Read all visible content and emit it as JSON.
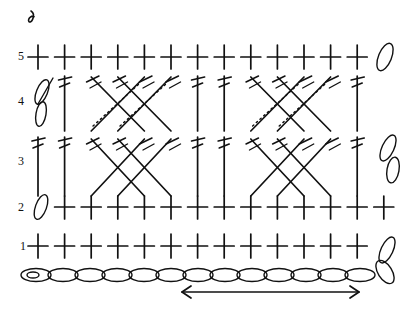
{
  "diagram": {
    "type": "crochet-pattern-chart",
    "width": 417,
    "height": 309,
    "ink_color": "#111111",
    "background_color": "#ffffff"
  },
  "row_labels": [
    {
      "label": "5",
      "x": 18,
      "y": 55
    },
    {
      "label": "4",
      "x": 18,
      "y": 100
    },
    {
      "label": "3",
      "x": 18,
      "y": 160
    },
    {
      "label": "2",
      "x": 18,
      "y": 207
    },
    {
      "label": "1",
      "x": 18,
      "y": 242
    }
  ],
  "rows": [
    {
      "number": "5",
      "y": 57,
      "stitch": "single-crochet",
      "symbol": "cross",
      "count": 13,
      "turning_chain_right": true
    },
    {
      "number": "4",
      "y": 100,
      "stitch": "crossed-treble-crochet",
      "symbol": "crossed-double-slash",
      "turning_chain_left": true
    },
    {
      "number": "3",
      "y": 158,
      "stitch": "crossed-treble-crochet",
      "symbol": "crossed-double-slash",
      "turning_chain_right": true
    },
    {
      "number": "2",
      "y": 207,
      "stitch": "single-crochet",
      "symbol": "cross",
      "count": 13,
      "turning_chain_left": true
    },
    {
      "number": "1",
      "y": 246,
      "stitch": "single-crochet",
      "symbol": "cross",
      "count": 13,
      "turning_chain_right": true
    }
  ],
  "columns": {
    "count": 13,
    "first_x": 38,
    "spacing": 26.6,
    "x_positions": [
      38,
      64.6,
      91.2,
      117.8,
      144.4,
      171,
      197.6,
      224.2,
      250.8,
      277.4,
      304,
      330.6,
      357.2
    ]
  },
  "foundation_chain": {
    "stitch": "chain",
    "symbol": "oval",
    "link_count": 14,
    "y": 275,
    "start_x": 22,
    "end_x": 393,
    "has_slip_knot_start": true
  },
  "repeat_arrow": {
    "type": "double-headed-arrow",
    "label": "pattern repeat",
    "x_start": 182,
    "x_end": 359,
    "y": 292
  },
  "start_marker": {
    "symbol": "chain-loop",
    "label": "start",
    "x": 31,
    "y": 20
  },
  "legend_note": ""
}
